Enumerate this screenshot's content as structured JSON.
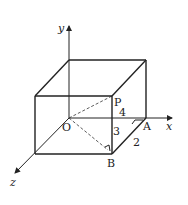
{
  "diagram": {
    "type": "3d-cuboid-with-axes",
    "axes": {
      "x": {
        "label": "x"
      },
      "y": {
        "label": "y"
      },
      "z": {
        "label": "z"
      }
    },
    "points": {
      "origin": {
        "label": "O"
      },
      "P": {
        "label": "P"
      },
      "A": {
        "label": "A"
      },
      "B": {
        "label": "B"
      }
    },
    "dimensions": {
      "OA_length": "4",
      "PB_height": "3",
      "AB_depth": "2"
    },
    "colors": {
      "stroke": "#222222",
      "background": "#ffffff"
    }
  }
}
